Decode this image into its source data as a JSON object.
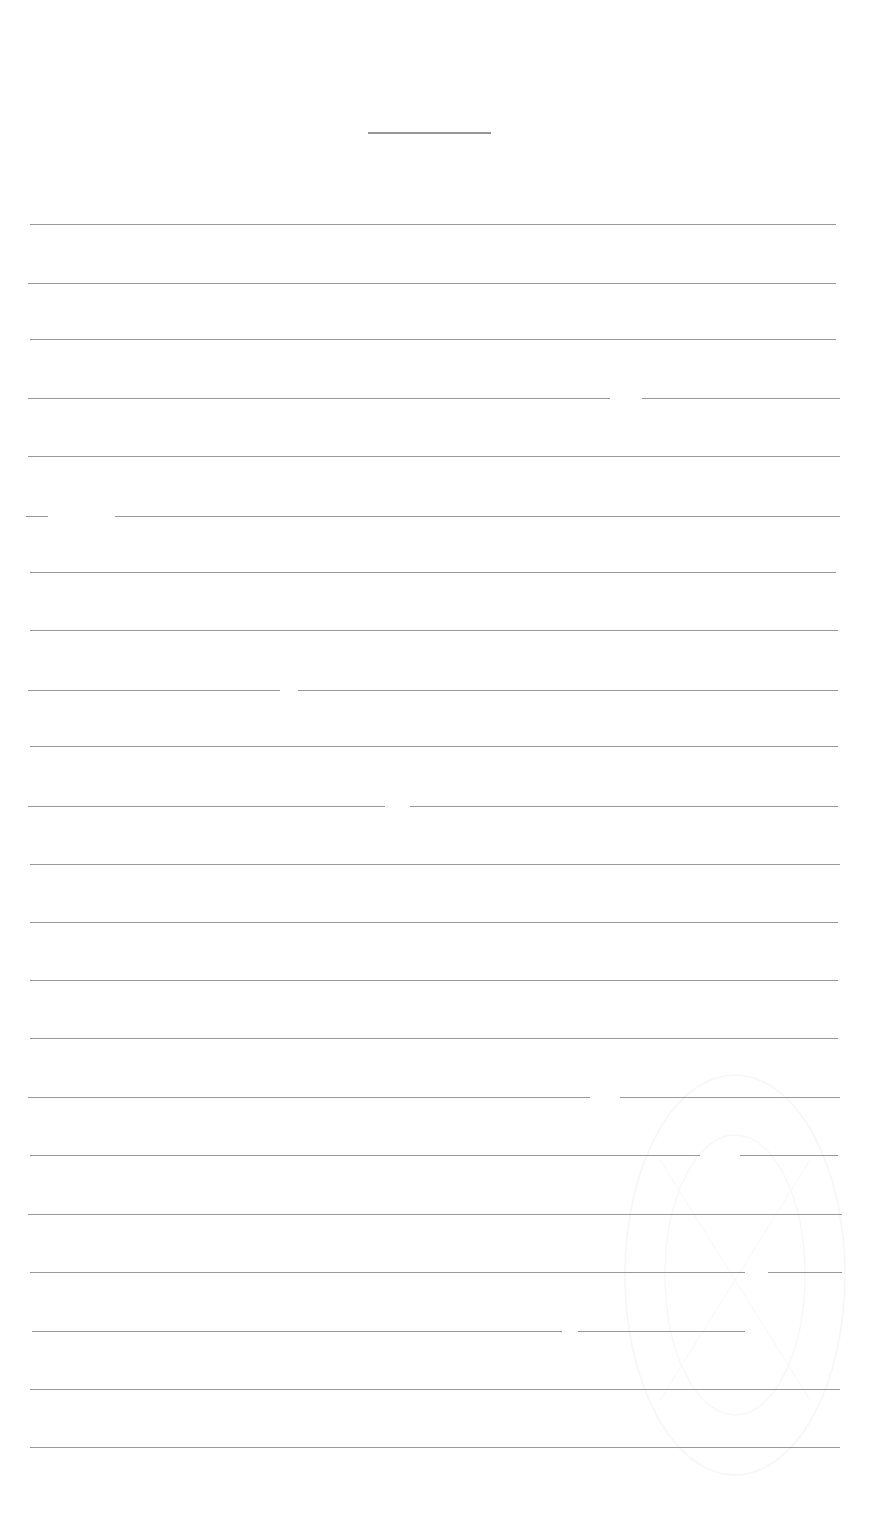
{
  "document": {
    "type": "lined-paper",
    "background_color": "#ffffff",
    "line_color": "#9a9a9a",
    "title_line": {
      "x1": 368,
      "x2": 491,
      "y": 132
    },
    "rules": [
      {
        "y": 224,
        "x1": 30,
        "x2": 836,
        "gaps": []
      },
      {
        "y": 283,
        "x1": 28,
        "x2": 836,
        "gaps": []
      },
      {
        "y": 339,
        "x1": 30,
        "x2": 836,
        "gaps": []
      },
      {
        "y": 398,
        "x1": 28,
        "x2": 840,
        "gaps": [
          [
            610,
            642
          ]
        ]
      },
      {
        "y": 456,
        "x1": 28,
        "x2": 840,
        "gaps": []
      },
      {
        "y": 516,
        "x1": 26,
        "x2": 840,
        "gaps": [
          [
            48,
            115
          ]
        ]
      },
      {
        "y": 572,
        "x1": 30,
        "x2": 836,
        "gaps": []
      },
      {
        "y": 630,
        "x1": 30,
        "x2": 838,
        "gaps": []
      },
      {
        "y": 690,
        "x1": 28,
        "x2": 838,
        "gaps": [
          [
            280,
            298
          ]
        ]
      },
      {
        "y": 746,
        "x1": 30,
        "x2": 838,
        "gaps": []
      },
      {
        "y": 806,
        "x1": 28,
        "x2": 838,
        "gaps": [
          [
            385,
            410
          ]
        ]
      },
      {
        "y": 864,
        "x1": 30,
        "x2": 840,
        "gaps": []
      },
      {
        "y": 922,
        "x1": 30,
        "x2": 838,
        "gaps": []
      },
      {
        "y": 980,
        "x1": 30,
        "x2": 838,
        "gaps": []
      },
      {
        "y": 1038,
        "x1": 30,
        "x2": 838,
        "gaps": []
      },
      {
        "y": 1097,
        "x1": 28,
        "x2": 840,
        "gaps": [
          [
            590,
            620
          ]
        ]
      },
      {
        "y": 1155,
        "x1": 30,
        "x2": 838,
        "gaps": [
          [
            700,
            740
          ]
        ]
      },
      {
        "y": 1214,
        "x1": 28,
        "x2": 842,
        "gaps": []
      },
      {
        "y": 1272,
        "x1": 30,
        "x2": 842,
        "gaps": [
          [
            745,
            768
          ]
        ]
      },
      {
        "y": 1331,
        "x1": 32,
        "x2": 745,
        "gaps": [
          [
            562,
            578
          ]
        ]
      },
      {
        "y": 1389,
        "x1": 30,
        "x2": 840,
        "gaps": []
      },
      {
        "y": 1447,
        "x1": 30,
        "x2": 840,
        "gaps": []
      }
    ]
  }
}
